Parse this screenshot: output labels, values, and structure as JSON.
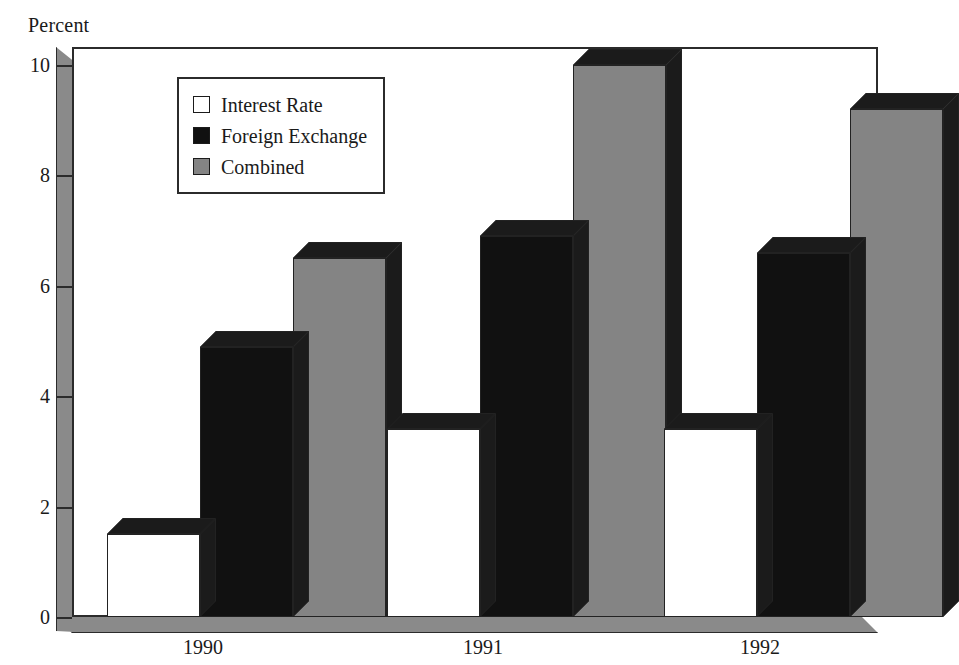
{
  "chart_data": {
    "type": "bar",
    "title": "",
    "ylabel": "Percent",
    "xlabel": "",
    "categories": [
      "1990",
      "1991",
      "1992"
    ],
    "series": [
      {
        "name": "Interest Rate",
        "color": "#ffffff",
        "values": [
          1.5,
          3.4,
          3.4
        ]
      },
      {
        "name": "Foreign Exchange",
        "color": "#111111",
        "values": [
          4.9,
          6.9,
          6.6
        ]
      },
      {
        "name": "Combined",
        "color": "#848484",
        "values": [
          6.5,
          10.0,
          9.2
        ]
      }
    ],
    "ylim": [
      0,
      10
    ],
    "yticks": [
      0,
      2,
      4,
      6,
      8,
      10
    ],
    "ytick_labels": [
      "0",
      "2",
      "4",
      "6",
      "8",
      "10"
    ],
    "grid": false,
    "legend_position": "upper-left-inside",
    "style": "3d-bars"
  },
  "axis": {
    "y_title": "Percent",
    "tick_0": "0",
    "tick_2": "2",
    "tick_4": "4",
    "tick_6": "6",
    "tick_8": "8",
    "tick_10": "10"
  },
  "categories": {
    "c0": "1990",
    "c1": "1991",
    "c2": "1992"
  },
  "legend": {
    "item0": "Interest Rate",
    "item1": "Foreign Exchange",
    "item2": "Combined"
  }
}
